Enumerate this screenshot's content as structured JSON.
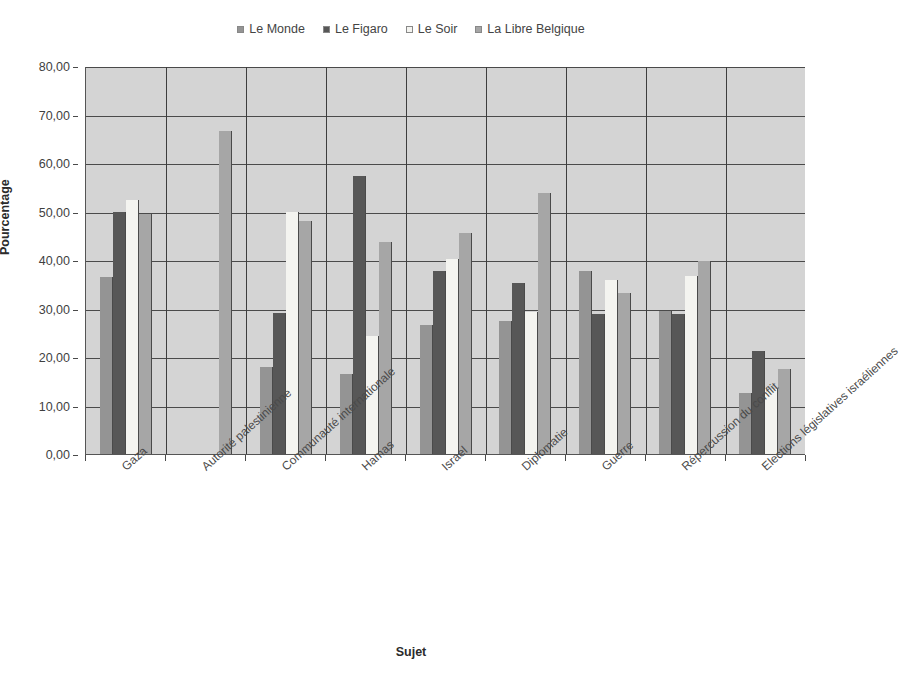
{
  "chart_data": {
    "type": "bar",
    "title": "",
    "xlabel": "Sujet",
    "ylabel": "Pourcentage",
    "ylim": [
      0,
      80
    ],
    "ytick_step": 10,
    "ytick_labels": [
      "0,00",
      "10,00",
      "20,00",
      "30,00",
      "40,00",
      "50,00",
      "60,00",
      "70,00",
      "80,00"
    ],
    "grid": true,
    "legend_position": "top-center",
    "categories": [
      "Gaza",
      "Autorité palestinienne",
      "Communauté internationale",
      "Hamas",
      "Israel",
      "Diplomatie",
      "Guerre",
      "Répercussion du conflit",
      "Elections législatives israéliennes"
    ],
    "series": [
      {
        "name": "Le Monde",
        "color": "#949494",
        "values": [
          36.5,
          0,
          18.0,
          16.5,
          26.5,
          27.5,
          37.8,
          29.5,
          12.5
        ]
      },
      {
        "name": "Le Figaro",
        "color": "#575757",
        "values": [
          50.0,
          0,
          29.0,
          57.3,
          37.8,
          35.2,
          28.8,
          28.8,
          21.2
        ]
      },
      {
        "name": "Le Soir",
        "color": "#f4f4f0",
        "values": [
          52.3,
          0,
          50.0,
          24.3,
          40.3,
          29.3,
          35.8,
          36.8,
          13.5
        ]
      },
      {
        "name": "La Libre Belgique",
        "color": "#a6a6a6",
        "values": [
          49.5,
          66.5,
          48.0,
          43.8,
          45.5,
          53.8,
          33.3,
          39.8,
          17.5
        ]
      }
    ]
  }
}
